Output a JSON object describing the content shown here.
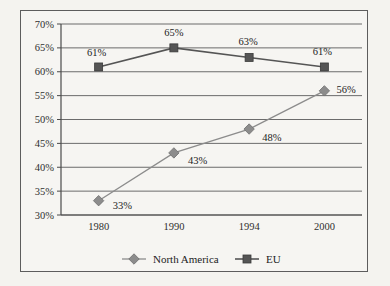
{
  "chart_data": {
    "type": "line",
    "title": "",
    "xlabel": "",
    "ylabel": "",
    "categories": [
      "1980",
      "1990",
      "1994",
      "2000"
    ],
    "ylim": [
      30,
      70
    ],
    "ytick_step": 5,
    "yticks": [
      "30%",
      "35%",
      "40%",
      "45%",
      "50%",
      "55%",
      "60%",
      "65%",
      "70%"
    ],
    "ytick_values": [
      30,
      35,
      40,
      45,
      50,
      55,
      60,
      65,
      70
    ],
    "grid": "horizontal",
    "legend_position": "bottom",
    "series": [
      {
        "name": "North America",
        "marker": "diamond",
        "color": "#8c8c8c",
        "values": [
          33,
          43,
          48,
          56
        ],
        "labels": [
          "33%",
          "43%",
          "48%",
          "56%"
        ]
      },
      {
        "name": "EU",
        "marker": "square",
        "color": "#555555",
        "values": [
          61,
          65,
          63,
          61
        ],
        "labels": [
          "61%",
          "65%",
          "63%",
          "61%"
        ]
      }
    ]
  },
  "legend": {
    "items": [
      {
        "label": "North America",
        "marker": "diamond",
        "color": "#8c8c8c"
      },
      {
        "label": "EU",
        "marker": "square",
        "color": "#555555"
      }
    ]
  },
  "colors": {
    "page_background": "#f4f3ef",
    "frame_background": "#f6f5f2",
    "frame_border": "#5d5d5d",
    "gridline": "#6b6b6b",
    "axis": "#4a4a4a",
    "north_america": "#8c8c8c",
    "eu": "#555555",
    "text": "#232323"
  }
}
